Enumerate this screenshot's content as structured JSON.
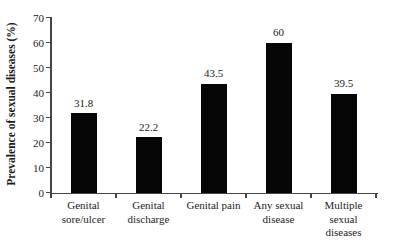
{
  "chart_data": {
    "type": "bar",
    "title": "",
    "categories": [
      "Genital sore/ulcer",
      "Genital discharge",
      "Genital pain",
      "Any sexual disease",
      "Multiple sexual diseases"
    ],
    "category_lines": [
      [
        "Genital",
        "sore/ulcer"
      ],
      [
        "Genital",
        "discharge"
      ],
      [
        "Genital pain"
      ],
      [
        "Any sexual",
        "disease"
      ],
      [
        "Multiple",
        "sexual",
        "diseases"
      ]
    ],
    "values": [
      31.8,
      22.2,
      43.5,
      60,
      39.5
    ],
    "value_labels": [
      "31.8",
      "22.2",
      "43.5",
      "60",
      "39.5"
    ],
    "xlabel": "",
    "ylabel": "Prevalence of sexual diseases (%)",
    "ylim": [
      0,
      70
    ],
    "yticks": [
      0,
      10,
      20,
      30,
      40,
      50,
      60,
      70
    ],
    "grid": false,
    "legend": null,
    "bar_color": "#050505",
    "axis_color": "#454545",
    "text_color": "#1c1c1c",
    "background_color": "#ffffff"
  }
}
